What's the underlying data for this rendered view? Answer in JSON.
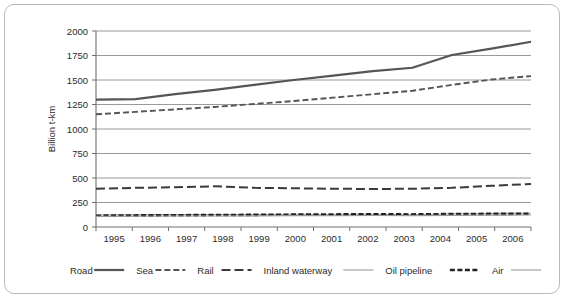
{
  "chart_data": {
    "type": "line",
    "title": "",
    "xlabel": "",
    "ylabel": "Billion t-km",
    "x": [
      1995,
      1996,
      1997,
      1998,
      1999,
      2000,
      2001,
      2002,
      2003,
      2004,
      2005,
      2006
    ],
    "xtick_labels": [
      "1995",
      "1996",
      "1997",
      "1998",
      "1999",
      "2000",
      "2001",
      "2002",
      "2003",
      "2004",
      "2005",
      "2006"
    ],
    "ytick_labels": [
      "0",
      "250",
      "500",
      "750",
      "1000",
      "1250",
      "1500",
      "1750",
      "2000"
    ],
    "yticks": [
      0,
      250,
      500,
      750,
      1000,
      1250,
      1500,
      1750,
      2000
    ],
    "ylim": [
      0,
      2000
    ],
    "xlim": [
      1995,
      2006
    ],
    "grid": "horizontal",
    "legend_position": "bottom",
    "series": [
      {
        "name": "Road",
        "style": "solid-thick",
        "color": "#555555",
        "width": 2.2,
        "dash": "none",
        "values": [
          1300,
          1305,
          1355,
          1400,
          1450,
          1500,
          1545,
          1590,
          1625,
          1755,
          1820,
          1890
        ]
      },
      {
        "name": "Sea",
        "style": "dashed-medium",
        "color": "#555555",
        "width": 1.9,
        "dash": "6,3",
        "values": [
          1150,
          1175,
          1200,
          1225,
          1255,
          1285,
          1320,
          1355,
          1390,
          1450,
          1505,
          1540
        ]
      },
      {
        "name": "Rail",
        "style": "dashed-long",
        "color": "#3a3a3a",
        "width": 2.0,
        "dash": "9,4",
        "values": [
          390,
          400,
          405,
          415,
          400,
          395,
          390,
          388,
          390,
          400,
          420,
          440
        ]
      },
      {
        "name": "Inland waterway",
        "style": "solid-thin",
        "color": "#9a9a9a",
        "width": 1.1,
        "dash": "none",
        "values": [
          122,
          124,
          126,
          128,
          128,
          130,
          128,
          130,
          125,
          135,
          138,
          140
        ]
      },
      {
        "name": "Oil pipeline",
        "style": "dashed-thick",
        "color": "#222222",
        "width": 2.6,
        "dash": "5,2.5",
        "values": [
          115,
          118,
          120,
          122,
          124,
          126,
          128,
          130,
          128,
          132,
          134,
          135
        ]
      },
      {
        "name": "Air",
        "style": "solid-thin",
        "color": "#9a9a9a",
        "width": 1.1,
        "dash": "none",
        "values": [
          108,
          110,
          112,
          113,
          114,
          116,
          115,
          117,
          116,
          119,
          121,
          122
        ]
      }
    ]
  },
  "legend": {
    "entries": [
      {
        "label": "Road",
        "sample": "solid-thick"
      },
      {
        "label": "Sea",
        "sample": "dashed-medium"
      },
      {
        "label": "Rail",
        "sample": "dashed-long"
      },
      {
        "label": "Inland waterway",
        "sample": "solid-thin"
      },
      {
        "label": "Oil pipeline",
        "sample": "dashed-thick"
      },
      {
        "label": "Air",
        "sample": "solid-thin"
      }
    ]
  },
  "axis": {
    "y_title": "Billion t-km"
  }
}
